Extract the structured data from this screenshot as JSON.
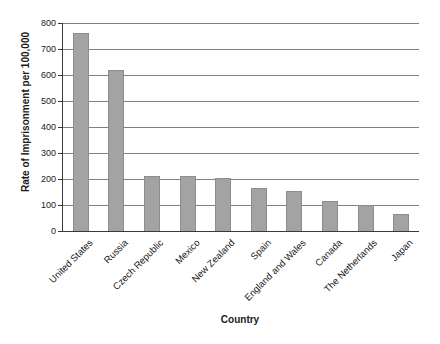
{
  "chart_data": {
    "type": "bar",
    "title": "",
    "categories": [
      "United States",
      "Russia",
      "Czech Republic",
      "Mexico",
      "New Zealand",
      "Spain",
      "England and Wales",
      "Canada",
      "The Netherlands",
      "Japan"
    ],
    "values": [
      760,
      620,
      210,
      210,
      205,
      165,
      155,
      115,
      100,
      65
    ],
    "xlabel": "Country",
    "ylabel": "Rate of Imprisonment per 100,000",
    "ylim": [
      0,
      800
    ],
    "yticks": [
      0,
      100,
      200,
      300,
      400,
      500,
      600,
      700,
      800
    ],
    "grid": "horizontal",
    "legend": "none",
    "colors": {
      "bar_fill": "#a3a3a3",
      "bar_edge": "#8d8d8d",
      "gridline": "#808080",
      "axis": "#3a3a3a",
      "text": "#1a1a1a",
      "background": "#ffffff"
    }
  }
}
